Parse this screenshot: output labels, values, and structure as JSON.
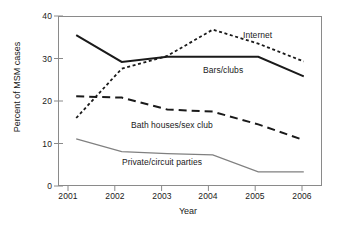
{
  "chart_data": {
    "type": "line",
    "title": "",
    "xlabel": "Year",
    "ylabel": "Percent of MSM cases",
    "categories": [
      "2001",
      "2002",
      "2003",
      "2004",
      "2005",
      "2006"
    ],
    "x": [
      2001,
      2002,
      2003,
      2004,
      2005,
      2006
    ],
    "xlim": [
      2000.6,
      2006.4
    ],
    "ylim": [
      0,
      40
    ],
    "yticks": [
      0,
      10,
      20,
      30,
      40
    ],
    "ytick_labels": [
      "0",
      "10",
      "20",
      "30",
      "40"
    ],
    "xticks": [
      2001,
      2002,
      2003,
      2004,
      2005,
      2006
    ],
    "xtick_labels": [
      "2001",
      "2002",
      "2003",
      "2004",
      "2005",
      "2006"
    ],
    "grid": false,
    "legend": "inline-annotations",
    "series": [
      {
        "name": "Internet",
        "values": [
          16.0,
          27.6,
          30.6,
          36.8,
          33.5,
          29.3
        ],
        "style": "dotted",
        "color": "#1a1a1a"
      },
      {
        "name": "Bars/clubs",
        "values": [
          35.5,
          29.2,
          30.4,
          30.4,
          30.4,
          25.8
        ],
        "style": "solid",
        "color": "#1a1a1a"
      },
      {
        "name": "Bath houses/sex club",
        "values": [
          21.1,
          20.8,
          18.0,
          17.5,
          14.5,
          10.8
        ],
        "style": "dashed",
        "color": "#1a1a1a"
      },
      {
        "name": "Private/circuit parties",
        "values": [
          11.1,
          8.1,
          7.6,
          7.3,
          3.3,
          3.3
        ],
        "style": "solid-thin",
        "color": "#808080"
      }
    ],
    "annotations": [
      {
        "text": "Internet",
        "series": "Internet"
      },
      {
        "text": "Bars/clubs",
        "series": "Bars/clubs"
      },
      {
        "text": "Bath houses/sex club",
        "series": "Bath houses/sex club"
      },
      {
        "text": "Private/circuit parties",
        "series": "Private/circuit parties"
      }
    ]
  }
}
